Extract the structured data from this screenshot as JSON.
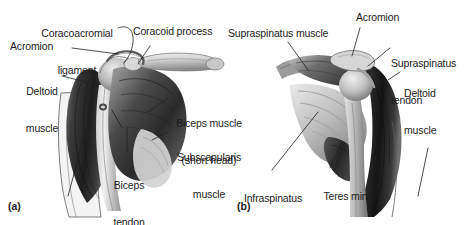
{
  "figure": {
    "background_color": "#ffffff",
    "text_color": "#1c1c1c",
    "width": 465,
    "height": 225
  },
  "panels": [
    {
      "id": "a",
      "letter": "(a)",
      "view": "anterior",
      "labels": [
        {
          "id": "coracoacromial-ligament",
          "text": "Coracoacromial\nligament",
          "align": "center"
        },
        {
          "id": "acromion-a",
          "text": "Acromion",
          "align": "left"
        },
        {
          "id": "deltoid-muscle-a",
          "text": "Deltoid\nmuscle",
          "align": "center"
        },
        {
          "id": "coracoid-process",
          "text": "Coracoid process",
          "align": "left"
        },
        {
          "id": "biceps-muscle-short-head",
          "text": "Biceps muscle\n(short head)",
          "align": "center"
        },
        {
          "id": "subscapularis-muscle",
          "text": "Subscapularis\nmuscle",
          "align": "center"
        },
        {
          "id": "biceps-tendon-long-head",
          "text": "Biceps\ntendon\n(long head)",
          "align": "center"
        }
      ]
    },
    {
      "id": "b",
      "letter": "(b)",
      "view": "posterior",
      "labels": [
        {
          "id": "supraspinatus-muscle",
          "text": "Supraspinatus muscle",
          "align": "left"
        },
        {
          "id": "acromion-b",
          "text": "Acromion",
          "align": "left"
        },
        {
          "id": "supraspinatus-tendon",
          "text": "Supraspinatus\ntendon",
          "align": "left"
        },
        {
          "id": "deltoid-muscle-b",
          "text": "Deltoid\nmuscle",
          "align": "left"
        },
        {
          "id": "infraspinatus-muscle",
          "text": "Infraspinatus\nmuscle",
          "align": "center"
        },
        {
          "id": "teres-minor-muscle",
          "text": "Teres minor\nmuscle",
          "align": "center"
        }
      ]
    }
  ],
  "text": {
    "coracoacromial_ligament_l1": "Coracoacromial",
    "coracoacromial_ligament_l2": "ligament",
    "acromion_a": "Acromion",
    "deltoid_a_l1": "Deltoid",
    "deltoid_a_l2": "muscle",
    "coracoid_process": "Coracoid process",
    "biceps_short_l1": "Biceps muscle",
    "biceps_short_l2": "(short head)",
    "subscapularis_l1": "Subscapularis",
    "subscapularis_l2": "muscle",
    "biceps_tendon_l1": "Biceps",
    "biceps_tendon_l2": "tendon",
    "biceps_tendon_l3": "(long head)",
    "panel_a_letter": "(a)",
    "supraspinatus_muscle": "Supraspinatus muscle",
    "acromion_b": "Acromion",
    "supraspinatus_tendon_l1": "Supraspinatus",
    "supraspinatus_tendon_l2": "tendon",
    "deltoid_b_l1": "Deltoid",
    "deltoid_b_l2": "muscle",
    "infraspinatus_l1": "Infraspinatus",
    "infraspinatus_l2": "muscle",
    "teres_minor_l1": "Teres minor",
    "teres_minor_l2": "muscle",
    "panel_b_letter": "(b)"
  }
}
